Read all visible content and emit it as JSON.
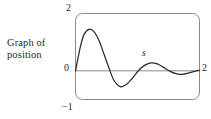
{
  "figure": {
    "caption_line1": "Graph of",
    "caption_line2": "position",
    "curve_label": "s"
  },
  "axis_labels": {
    "top_left": "2",
    "origin": "0",
    "bottom_left": "−1",
    "right": "2"
  },
  "colors": {
    "background": "#ffffff",
    "curve": "#2b2b2b",
    "box_border": "#8a8a8a",
    "axis_line": "#8a8a8a",
    "text": "#1f1f1f"
  },
  "chart_data": {
    "type": "line",
    "title": "",
    "subtitle": "",
    "xlabel": "",
    "ylabel": "",
    "xlim": [
      0,
      2
    ],
    "ylim": [
      -1,
      2
    ],
    "xticks": [
      0,
      2
    ],
    "xticklabels": [
      "0",
      "2"
    ],
    "yticks": [
      -1,
      0,
      2
    ],
    "yticklabels": [
      "−1",
      "0",
      "2"
    ],
    "grid": false,
    "legend": null,
    "annotations": [
      {
        "text": "s",
        "x": 1.22,
        "y": 0.45,
        "style": "italic",
        "note": "curve name label above third hump"
      },
      {
        "text": "Graph of position",
        "x": null,
        "y": null,
        "note": "caption outside plot box, to the left"
      }
    ],
    "series": [
      {
        "name": "s",
        "description": "damped oscillation of position versus time starting at the origin",
        "x": [
          0.0,
          0.08,
          0.14,
          0.22,
          0.3,
          0.38,
          0.46,
          0.54,
          0.62,
          0.72,
          0.82,
          0.92,
          1.02,
          1.12,
          1.22,
          1.32,
          1.42,
          1.52,
          1.62,
          1.72,
          1.82,
          1.92,
          2.0
        ],
        "y": [
          0.0,
          0.85,
          1.28,
          1.45,
          1.36,
          1.05,
          0.58,
          0.1,
          -0.33,
          -0.55,
          -0.48,
          -0.25,
          0.02,
          0.2,
          0.28,
          0.24,
          0.12,
          -0.01,
          -0.1,
          -0.12,
          -0.08,
          -0.02,
          0.02
        ]
      }
    ],
    "key_points": [
      {
        "label": "start",
        "x": 0.0,
        "y": 0.0
      },
      {
        "label": "first maximum",
        "x": 0.22,
        "y": 1.45
      },
      {
        "label": "first minimum",
        "x": 0.72,
        "y": -0.55
      },
      {
        "label": "second maximum",
        "x": 1.22,
        "y": 0.28
      },
      {
        "label": "second minimum",
        "x": 1.72,
        "y": -0.12
      },
      {
        "label": "end",
        "x": 2.0,
        "y": 0.02
      }
    ]
  }
}
